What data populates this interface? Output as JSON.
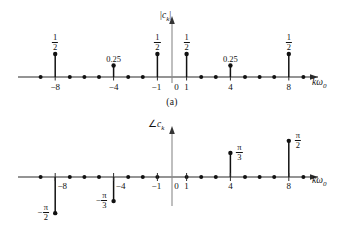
{
  "figure": {
    "panels": [
      {
        "id": "a",
        "caption": "(a)",
        "ylabel": "|c_k|",
        "ylabel_parts": {
          "bar_left": "|",
          "c": "c",
          "sub": "k",
          "bar_right": "|"
        },
        "xlabel": "kω₀",
        "xlabel_parts": {
          "k": "k",
          "omega": "ω",
          "sub": "0"
        }
      },
      {
        "id": "b",
        "caption": "(b)",
        "ylabel": "∠c_k",
        "ylabel_parts": {
          "angle": "∠",
          "c": "c",
          "sub": "k"
        },
        "xlabel": "kω₀",
        "xlabel_parts": {
          "k": "k",
          "omega": "ω",
          "sub": "0"
        }
      }
    ]
  },
  "chart_data": [
    {
      "type": "scatter",
      "id": "magnitude-spectrum",
      "title": "|c_k| magnitude spectrum",
      "subtitle": "(a)",
      "xlabel": "kω₀",
      "ylabel": "|c_k|",
      "grid": false,
      "legend": false,
      "xlim": [
        -10,
        10
      ],
      "ylim": [
        0,
        0.6
      ],
      "xticks": [
        -8,
        -4,
        -1,
        0,
        1,
        4,
        8
      ],
      "xtick_labels": [
        "−8",
        "−4",
        "−1",
        "0",
        "1",
        "4",
        "8"
      ],
      "x": [
        -9,
        -8,
        -7,
        -6,
        -5,
        -4,
        -3,
        -2,
        -1,
        1,
        2,
        3,
        4,
        5,
        6,
        7,
        8,
        9
      ],
      "values": [
        0,
        0.5,
        0,
        0,
        0,
        0.25,
        0,
        0,
        0.5,
        0.5,
        0,
        0,
        0.25,
        0,
        0,
        0,
        0.5,
        0
      ],
      "stems": [
        {
          "k": -8,
          "value": 0.5,
          "label": "1/2",
          "label_type": "fraction",
          "num": "1",
          "den": "2"
        },
        {
          "k": -4,
          "value": 0.25,
          "label": "0.25",
          "label_type": "decimal"
        },
        {
          "k": -1,
          "value": 0.5,
          "label": "1/2",
          "label_type": "fraction",
          "num": "1",
          "den": "2"
        },
        {
          "k": 1,
          "value": 0.5,
          "label": "1/2",
          "label_type": "fraction",
          "num": "1",
          "den": "2"
        },
        {
          "k": 4,
          "value": 0.25,
          "label": "0.25",
          "label_type": "decimal"
        },
        {
          "k": 8,
          "value": 0.5,
          "label": "1/2",
          "label_type": "fraction",
          "num": "1",
          "den": "2"
        }
      ],
      "zero_points": [
        -9,
        -7,
        -6,
        -5,
        -3,
        -2,
        2,
        3,
        5,
        6,
        7,
        9
      ]
    },
    {
      "type": "scatter",
      "id": "phase-spectrum",
      "title": "∠c_k phase spectrum",
      "subtitle": "(b)",
      "xlabel": "kω₀",
      "ylabel": "∠c_k",
      "grid": false,
      "legend": false,
      "xlim": [
        -10,
        10
      ],
      "ylim": [
        -1.8,
        1.8
      ],
      "xticks": [
        -8,
        -4,
        -1,
        0,
        1,
        4,
        8
      ],
      "xtick_labels": [
        "−8",
        "−4",
        "−1",
        "0",
        "1",
        "4",
        "8"
      ],
      "x": [
        -9,
        -8,
        -7,
        -6,
        -5,
        -4,
        -3,
        -2,
        -1,
        1,
        2,
        3,
        4,
        5,
        6,
        7,
        8,
        9
      ],
      "values": [
        0,
        -1.5708,
        0,
        0,
        0,
        -1.0472,
        0,
        0,
        0,
        0,
        0,
        0,
        1.0472,
        0,
        0,
        0,
        1.5708,
        0
      ],
      "stems": [
        {
          "k": -8,
          "value": -1.5708,
          "label": "-π/2",
          "label_type": "fraction",
          "sign": "−",
          "num": "π",
          "den": "2"
        },
        {
          "k": -4,
          "value": -1.0472,
          "label": "-π/3",
          "label_type": "fraction",
          "sign": "−",
          "num": "π",
          "den": "3"
        },
        {
          "k": 4,
          "value": 1.0472,
          "label": "π/3",
          "label_type": "fraction",
          "sign": "",
          "num": "π",
          "den": "3"
        },
        {
          "k": 8,
          "value": 1.5708,
          "label": "π/2",
          "label_type": "fraction",
          "sign": "",
          "num": "π",
          "den": "2"
        }
      ],
      "zero_points": [
        -9,
        -7,
        -6,
        -5,
        -3,
        -2,
        -1,
        1,
        2,
        3,
        5,
        6,
        7,
        9
      ]
    }
  ],
  "colors": {
    "ink": "#111111",
    "axis": "#2a2a2a",
    "vertical_axis": "#8a8a8a",
    "background": "#ffffff"
  }
}
